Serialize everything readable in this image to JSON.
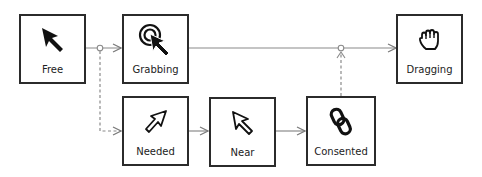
{
  "diagram": {
    "type": "state-diagram",
    "colors": {
      "stroke": "#2b2b2b",
      "line": "#8a8a8a",
      "background": "#ffffff"
    },
    "nodes": [
      {
        "id": "free",
        "label": "Free",
        "icon": "filled-arrow-cursor-icon"
      },
      {
        "id": "grabbing",
        "label": "Grabbing",
        "icon": "arrow-cursor-with-target-icon"
      },
      {
        "id": "dragging",
        "label": "Dragging",
        "icon": "open-hand-icon"
      },
      {
        "id": "needed",
        "label": "Needed",
        "icon": "outline-arrow-up-right-icon"
      },
      {
        "id": "near",
        "label": "Near",
        "icon": "outline-arrow-cursor-icon"
      },
      {
        "id": "consented",
        "label": "Consented",
        "icon": "chain-link-icon"
      }
    ],
    "edges": [
      {
        "from": "free",
        "to": "grabbing",
        "style": "solid"
      },
      {
        "from": "free",
        "to": "needed",
        "style": "dashed",
        "via": "junction"
      },
      {
        "from": "grabbing",
        "to": "dragging",
        "style": "solid"
      },
      {
        "from": "needed",
        "to": "near",
        "style": "solid"
      },
      {
        "from": "near",
        "to": "consented",
        "style": "solid"
      },
      {
        "from": "consented",
        "to": "dragging",
        "style": "dashed",
        "via": "junction"
      }
    ]
  }
}
